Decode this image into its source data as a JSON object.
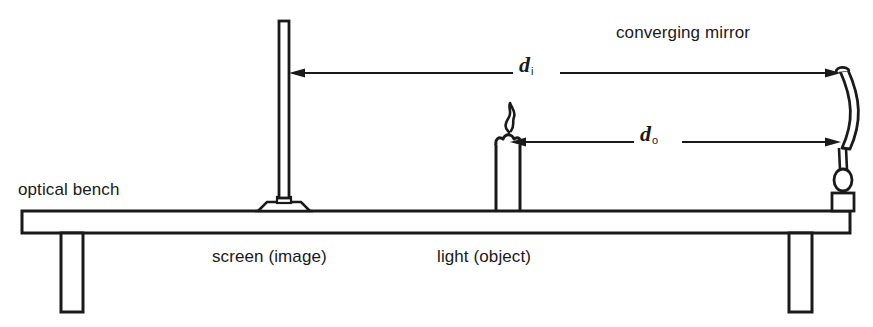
{
  "diagram": {
    "stroke_color": "#1a1a1a",
    "background_color": "#ffffff",
    "width": 873,
    "height": 327,
    "labels": {
      "converging_mirror": "converging mirror",
      "optical_bench": "optical bench",
      "screen_image": "screen (image)",
      "light_object": "light (object)",
      "image_distance_symbol": "d",
      "image_distance_subscript": "i",
      "object_distance_symbol": "d",
      "object_distance_subscript": "o"
    },
    "components": [
      {
        "name": "optical-bench",
        "label": "optical bench"
      },
      {
        "name": "bench-leg-left",
        "label": ""
      },
      {
        "name": "bench-leg-right",
        "label": ""
      },
      {
        "name": "screen",
        "label": "screen (image)"
      },
      {
        "name": "candle",
        "label": "light (object)"
      },
      {
        "name": "converging-mirror",
        "label": "converging mirror"
      }
    ],
    "measurements": [
      {
        "name": "image-distance",
        "symbol": "d",
        "subscript": "i",
        "from": "converging mirror",
        "to": "screen (image)"
      },
      {
        "name": "object-distance",
        "symbol": "d",
        "subscript": "o",
        "from": "converging mirror",
        "to": "light (object)"
      }
    ]
  }
}
